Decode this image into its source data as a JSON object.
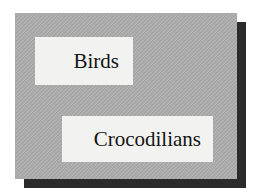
{
  "figure": {
    "name": "taxa-label-diagram",
    "background_color": "#ffffff",
    "panel": {
      "fill_color": "#a8a8a8",
      "texture": "halftone-dither",
      "shadow_color": "#2b2b2b"
    },
    "labels": [
      {
        "id": "birds",
        "text": "Birds",
        "box_fill": "#f2f2f0",
        "text_color": "#141414"
      },
      {
        "id": "crocodilians",
        "text": "Crocodilians",
        "box_fill": "#f2f2f0",
        "text_color": "#141414"
      }
    ]
  }
}
